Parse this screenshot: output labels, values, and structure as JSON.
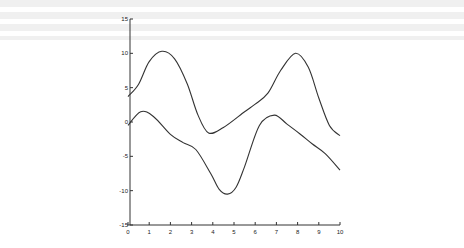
{
  "chart_data": {
    "type": "line",
    "title": "",
    "xlabel": "",
    "ylabel": "",
    "xlim": [
      0,
      10
    ],
    "ylim": [
      -15,
      15
    ],
    "grid": false,
    "legend": null,
    "x_ticks": [
      "0",
      "1",
      "2",
      "3",
      "4",
      "5",
      "6",
      "7",
      "8",
      "9",
      "10"
    ],
    "y_ticks": [
      "15",
      "10",
      "5",
      "0",
      "-5",
      "-10",
      "-15"
    ],
    "series": [
      {
        "name": "upper curve",
        "color": "#333333",
        "x": [
          0,
          0.5,
          1.0,
          1.6,
          2.2,
          2.8,
          3.3,
          3.8,
          4.5,
          5.5,
          6.0,
          6.6,
          7.2,
          7.9,
          8.5,
          9.0,
          9.5,
          10.0
        ],
        "values": [
          3.7,
          5.5,
          8.8,
          10.3,
          9.2,
          5.5,
          1.0,
          -1.6,
          -0.8,
          1.5,
          2.6,
          4.2,
          7.5,
          10.0,
          8.0,
          3.5,
          -0.5,
          -2.0
        ]
      },
      {
        "name": "lower curve",
        "color": "#333333",
        "x": [
          0,
          0.6,
          1.2,
          2.0,
          2.6,
          3.2,
          3.9,
          4.3,
          4.7,
          5.1,
          5.5,
          6.2,
          6.9,
          7.5,
          8.1,
          8.7,
          9.3,
          10.0
        ],
        "values": [
          -0.5,
          1.5,
          0.8,
          -1.8,
          -3.0,
          -4.0,
          -7.5,
          -9.8,
          -10.5,
          -9.5,
          -6.5,
          -0.5,
          1.0,
          -0.3,
          -1.7,
          -3.2,
          -4.6,
          -7.0
        ]
      }
    ]
  }
}
